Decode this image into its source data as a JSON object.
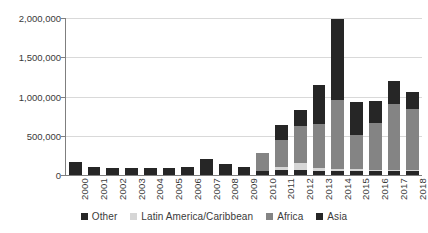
{
  "chart_data": {
    "type": "bar",
    "subtype": "stacked-bar",
    "title": "",
    "subtitle": "",
    "xlabel": "",
    "ylabel": "",
    "ylim": [
      0,
      2000000
    ],
    "yticks": [
      0,
      500000,
      1000000,
      1500000,
      2000000
    ],
    "ytick_labels": [
      "0",
      "500,000",
      "1,000,000",
      "1,500,000",
      "2,000,000"
    ],
    "grid": true,
    "grid_axis": "y",
    "legend_position": "bottom",
    "categories": [
      "2000",
      "2001",
      "2002",
      "2003",
      "2004",
      "2005",
      "2006",
      "2007",
      "2008",
      "2009",
      "2010",
      "2011",
      "2012",
      "2013",
      "2014",
      "2015",
      "2016",
      "2017",
      "2018"
    ],
    "series": [
      {
        "name": "Other",
        "color": "#262626",
        "values": [
          160000,
          100000,
          90000,
          85000,
          95000,
          90000,
          100000,
          205000,
          140000,
          100000,
          55000,
          60000,
          60000,
          50000,
          50000,
          50000,
          50000,
          50000,
          50000
        ]
      },
      {
        "name": "Latin America/Caribbean",
        "color": "#d6d6d6",
        "values": [
          0,
          0,
          0,
          0,
          0,
          0,
          0,
          0,
          0,
          0,
          0,
          45000,
          90000,
          35000,
          30000,
          25000,
          20000,
          20000,
          20000
        ]
      },
      {
        "name": "Africa",
        "color": "#848484",
        "values": [
          0,
          0,
          0,
          0,
          0,
          0,
          0,
          0,
          0,
          0,
          220000,
          345000,
          480000,
          560000,
          870000,
          430000,
          590000,
          830000,
          770000
        ]
      },
      {
        "name": "Asia",
        "color": "#262626",
        "values": [
          0,
          0,
          0,
          0,
          0,
          0,
          0,
          0,
          0,
          0,
          0,
          190000,
          200000,
          500000,
          1040000,
          430000,
          280000,
          300000,
          220000
        ]
      }
    ],
    "totals": [
      160000,
      100000,
      90000,
      85000,
      95000,
      90000,
      100000,
      205000,
      140000,
      100000,
      275000,
      640000,
      830000,
      1145000,
      1990000,
      935000,
      940000,
      1200000,
      1060000
    ]
  },
  "legend": {
    "items": [
      {
        "label": "Other",
        "color": "#262626"
      },
      {
        "label": "Latin America/Caribbean",
        "color": "#d6d6d6"
      },
      {
        "label": "Africa",
        "color": "#848484"
      },
      {
        "label": "Asia",
        "color": "#262626"
      }
    ]
  }
}
